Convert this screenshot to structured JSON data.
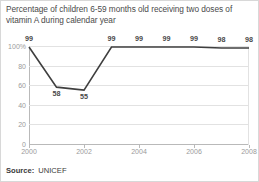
{
  "chart_data": {
    "type": "line",
    "title": "Percentage of children 6-59 months old receiving two doses of vitamin A during calendar year",
    "xlabel": "",
    "ylabel": "",
    "x": [
      2000,
      2001,
      2002,
      2003,
      2004,
      2005,
      2006,
      2007,
      2008
    ],
    "values": [
      99,
      58,
      55,
      99,
      99,
      99,
      99,
      98,
      98
    ],
    "point_labels": [
      "99",
      "58",
      "55",
      "99",
      "99",
      "99",
      "99",
      "98",
      "98"
    ],
    "ylim": [
      0,
      100
    ],
    "xlim": [
      2000,
      2008
    ],
    "ytick_labels": [
      "100%",
      "80",
      "60",
      "40",
      "20",
      "0"
    ],
    "ytick_values": [
      100,
      80,
      60,
      40,
      20,
      0
    ],
    "xtick_labels": [
      "2000",
      "2002",
      "2004",
      "2006",
      "2008"
    ],
    "xtick_values": [
      2000,
      2002,
      2004,
      2006,
      2008
    ],
    "grid": true,
    "legend": "none",
    "line_color": "#3f3f3f",
    "grid_color": "#e2e2e2",
    "axis_color": "#b9b9b9",
    "label_color": "#9a9a9a",
    "title_color": "#4a4a4a"
  },
  "footer": {
    "source_label": "Source:",
    "source_value": "UNICEF"
  }
}
